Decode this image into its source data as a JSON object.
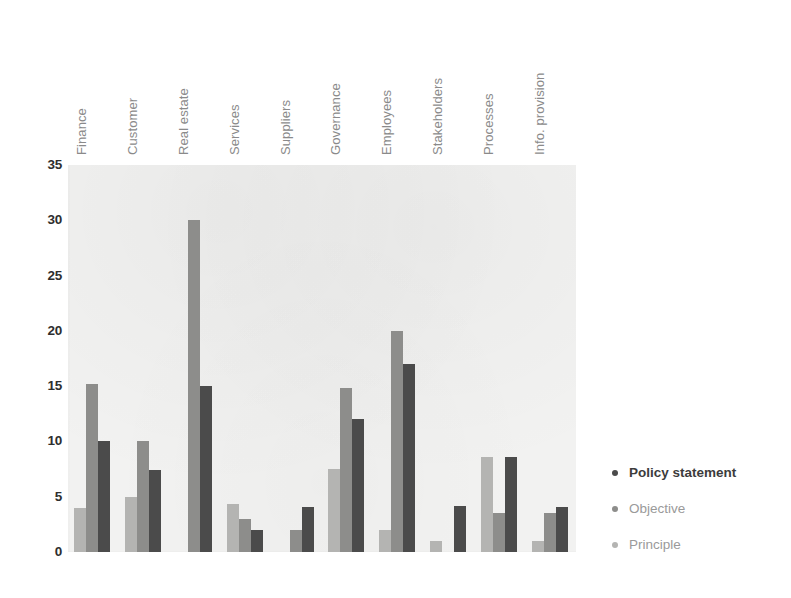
{
  "chart_data": {
    "type": "bar",
    "title": "",
    "subtitle": "",
    "xlabel": "",
    "ylabel": "",
    "ylim": [
      0,
      35
    ],
    "yticks": [
      "0",
      "5",
      "10",
      "15",
      "20",
      "25",
      "30",
      "35"
    ],
    "grid": false,
    "legend_position": "right",
    "categories": [
      "Finance",
      "Customer",
      "Real estate",
      "Services",
      "Suppliers",
      "Governance",
      "Employees",
      "Stakeholders",
      "Processes",
      "Info. provision"
    ],
    "series": [
      {
        "name": "Principle",
        "color": "#b4b4b2",
        "values": [
          4,
          5,
          0,
          4.3,
          0,
          7.5,
          2,
          1,
          8.6,
          1
        ]
      },
      {
        "name": "Objective",
        "color": "#8d8d8b",
        "values": [
          15.2,
          10,
          30,
          3,
          2,
          14.8,
          20,
          0,
          3.5,
          3.5
        ]
      },
      {
        "name": "Policy statement",
        "color": "#4b4b4b",
        "values": [
          10,
          7.4,
          15,
          2,
          4.1,
          12,
          17,
          4.2,
          8.6,
          4.1
        ]
      }
    ]
  },
  "legend": {
    "items": [
      {
        "label": "Policy statement",
        "color": "#4b4b4b"
      },
      {
        "label": "Objective",
        "color": "#8d8d8b"
      },
      {
        "label": "Principle",
        "color": "#b4b4b2"
      }
    ]
  }
}
